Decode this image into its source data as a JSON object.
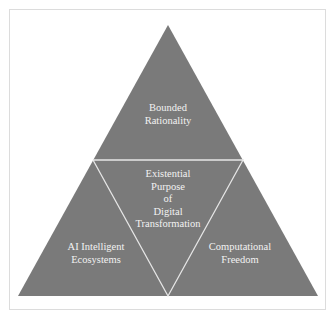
{
  "diagram": {
    "type": "triangle-quadrant",
    "colors": {
      "fill": "#7a7a7a",
      "divider": "#e6e6e6",
      "text": "#f2f2f2",
      "frame": "#dcdcdc",
      "background": "#ffffff"
    },
    "segments": {
      "top": {
        "label": "Bounded\nRationality"
      },
      "center": {
        "label": "Existential\nPurpose\nof\nDigital\nTransformation"
      },
      "bottom_left": {
        "label": "AI Intelligent\nEcosystems"
      },
      "bottom_right": {
        "label": "Computational\nFreedom"
      }
    }
  }
}
